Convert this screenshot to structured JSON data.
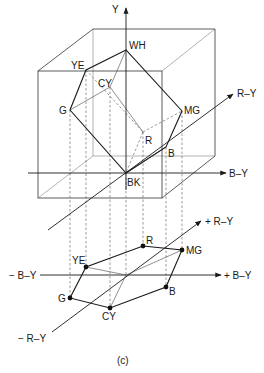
{
  "figure": {
    "caption": "(c)",
    "cube": {
      "y_axis_label": "Y",
      "ry_axis_label": "R–Y",
      "by_axis_label": "B–Y",
      "vertices": [
        {
          "id": "WH",
          "label": "WH"
        },
        {
          "id": "YE",
          "label": "YE"
        },
        {
          "id": "CY",
          "label": "CY"
        },
        {
          "id": "G",
          "label": "G"
        },
        {
          "id": "MG",
          "label": "MG"
        },
        {
          "id": "R",
          "label": "R"
        },
        {
          "id": "B",
          "label": "B"
        },
        {
          "id": "BK",
          "label": "BK"
        }
      ]
    },
    "projection": {
      "plus_ry_label": "+ R–Y",
      "minus_ry_label": "− R–Y",
      "plus_by_label": "+ B–Y",
      "minus_by_label": "− B–Y",
      "points": [
        {
          "id": "R",
          "label": "R"
        },
        {
          "id": "MG",
          "label": "MG"
        },
        {
          "id": "YE",
          "label": "YE"
        },
        {
          "id": "B",
          "label": "B"
        },
        {
          "id": "G",
          "label": "G"
        },
        {
          "id": "CY",
          "label": "CY"
        }
      ]
    }
  }
}
